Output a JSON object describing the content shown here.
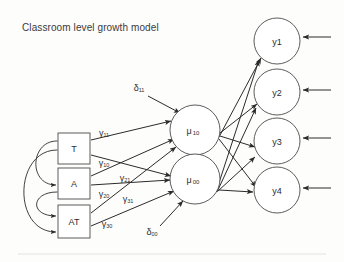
{
  "figure": {
    "title": "Classroom level growth model",
    "type": "path-diagram",
    "background_color": "#fdfdfc",
    "line_color": "#2b2b2b",
    "shape_fill": "#ffffff",
    "shape_stroke": "#4a4a4a",
    "text_color": "#2e2e2e"
  },
  "observed_predictors": [
    {
      "id": "T",
      "label": "T",
      "shape": "rectangle",
      "x": 58,
      "y": 133,
      "w": 32,
      "h": 31
    },
    {
      "id": "A",
      "label": "A",
      "shape": "rectangle",
      "x": 58,
      "y": 168,
      "w": 32,
      "h": 31
    },
    {
      "id": "AT",
      "label": "AT",
      "shape": "rectangle",
      "x": 58,
      "y": 205,
      "w": 32,
      "h": 33
    }
  ],
  "latent_factors": [
    {
      "id": "mu10",
      "label": "μ",
      "subscript": "10",
      "shape": "circle",
      "cx": 195,
      "cy": 130,
      "r": 25
    },
    {
      "id": "mu00",
      "label": "μ",
      "subscript": "00",
      "shape": "circle",
      "cx": 195,
      "cy": 179,
      "r": 25
    }
  ],
  "outcomes": [
    {
      "id": "y1",
      "label": "y1",
      "shape": "circle",
      "cx": 277,
      "cy": 41,
      "r": 23
    },
    {
      "id": "y2",
      "label": "y2",
      "shape": "circle",
      "cx": 277,
      "cy": 92,
      "r": 23
    },
    {
      "id": "y3",
      "label": "y3",
      "shape": "circle",
      "cx": 277,
      "cy": 141,
      "r": 23
    },
    {
      "id": "y4",
      "label": "y4",
      "shape": "circle",
      "cx": 277,
      "cy": 190,
      "r": 23
    }
  ],
  "disturbances": [
    {
      "id": "d11",
      "label": "δ",
      "subscript": "11",
      "x": 138,
      "y": 89,
      "target": "mu10"
    },
    {
      "id": "d00",
      "label": "δ",
      "subscript": "00",
      "x": 152,
      "y": 230,
      "target": "mu00"
    }
  ],
  "path_labels": [
    {
      "id": "g11",
      "label": "γ",
      "subscript": "11",
      "x": 104,
      "y": 133,
      "from": "T",
      "to": "mu10"
    },
    {
      "id": "g10",
      "label": "γ",
      "subscript": "10",
      "x": 104,
      "y": 163,
      "from": "T",
      "to": "mu00"
    },
    {
      "id": "g21",
      "label": "γ",
      "subscript": "21",
      "x": 125,
      "y": 178,
      "from": "A",
      "to": "mu10"
    },
    {
      "id": "g20",
      "label": "γ",
      "subscript": "20",
      "x": 104,
      "y": 194,
      "from": "A",
      "to": "mu00"
    },
    {
      "id": "g31",
      "label": "γ",
      "subscript": "31",
      "x": 128,
      "y": 199,
      "from": "AT",
      "to": "mu10"
    },
    {
      "id": "g30",
      "label": "γ",
      "subscript": "30",
      "x": 107,
      "y": 224,
      "from": "AT",
      "to": "mu30"
    }
  ],
  "covariances": [
    {
      "id": "cov-t-a",
      "from": "T",
      "to": "A"
    },
    {
      "id": "cov-a-at",
      "from": "A",
      "to": "AT"
    },
    {
      "id": "cov-t-at",
      "from": "T",
      "to": "AT"
    }
  ],
  "loadings": [
    {
      "from": "mu10",
      "to": "y1"
    },
    {
      "from": "mu10",
      "to": "y2"
    },
    {
      "from": "mu10",
      "to": "y3"
    },
    {
      "from": "mu10",
      "to": "y4"
    },
    {
      "from": "mu00",
      "to": "y1"
    },
    {
      "from": "mu00",
      "to": "y2"
    },
    {
      "from": "mu00",
      "to": "y3"
    },
    {
      "from": "mu00",
      "to": "y4"
    }
  ],
  "residual_arrows": [
    {
      "id": "res-y1",
      "target": "y1"
    },
    {
      "id": "res-y2",
      "target": "y2"
    },
    {
      "id": "res-y3",
      "target": "y3"
    },
    {
      "id": "res-y4",
      "target": "y4"
    }
  ]
}
